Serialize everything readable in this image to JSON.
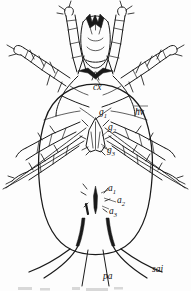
{
  "figure": {
    "view": "ventral",
    "ink_color": "#1a1a1a",
    "background_color": "#fdfdfd",
    "width_px": 191,
    "height_px": 291
  },
  "labels": {
    "cx": {
      "text": "cx",
      "sub": "",
      "x": 96,
      "y": 88,
      "meaning": "coxa"
    },
    "g1": {
      "text": "g",
      "sub": "1",
      "x": 101,
      "y": 113,
      "meaning": "genital seta 1"
    },
    "g2": {
      "text": "g",
      "sub": "2",
      "x": 110,
      "y": 128,
      "meaning": "genital seta 2"
    },
    "g3": {
      "text": "g",
      "sub": "3",
      "x": 109,
      "y": 151,
      "meaning": "genital seta 3"
    },
    "hv": {
      "text": "hv",
      "sub": "",
      "x": 138,
      "y": 113,
      "meaning": "ventral hypostomal seta"
    },
    "a1": {
      "text": "a",
      "sub": "1",
      "x": 110,
      "y": 189,
      "meaning": "anal seta 1"
    },
    "a2": {
      "text": "a",
      "sub": "2",
      "x": 118,
      "y": 201,
      "meaning": "anal seta 2"
    },
    "a3": {
      "text": "a",
      "sub": "3",
      "x": 111,
      "y": 212,
      "meaning": "anal seta 3"
    },
    "pa": {
      "text": "pa",
      "sub": "",
      "x": 108,
      "y": 277,
      "meaning": "post-anal seta"
    },
    "sai": {
      "text": "sai",
      "sub": "",
      "x": 155,
      "y": 270,
      "meaning": "sensory seta ai"
    }
  },
  "structures": {
    "idiosoma": "oval body outline",
    "gnathosoma": "anterior mouthparts with chelicerae",
    "legs": "four pairs of segmented legs bearing setae",
    "genital_shield": "median arrow-shaped genital valve",
    "anal_opening": "elongate median anal slit",
    "caudal_setae": "four long posterior setae"
  }
}
